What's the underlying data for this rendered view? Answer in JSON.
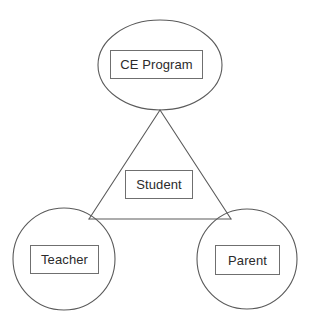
{
  "diagram": {
    "type": "relationship-diagram",
    "background_color": "#ffffff",
    "stroke_color": "#5a5a5a",
    "label_border_color": "#6f6f6f",
    "text_color": "#2b2b2b",
    "nodes": [
      {
        "id": "ce-program",
        "label": "CE Program",
        "shape": "ellipse",
        "cx": 160,
        "cy": 65,
        "rx": 62,
        "ry": 45
      },
      {
        "id": "teacher",
        "label": "Teacher",
        "shape": "circle",
        "cx": 64,
        "cy": 259,
        "rx": 51,
        "ry": 51
      },
      {
        "id": "parent",
        "label": "Parent",
        "shape": "circle",
        "cx": 247,
        "cy": 259,
        "rx": 50,
        "ry": 50
      },
      {
        "id": "student",
        "label": "Student",
        "shape": "rectangle",
        "cx": 159,
        "cy": 184
      }
    ],
    "connections": [
      {
        "id": "ce-program-to-teacher",
        "from": "ce-program",
        "to": "teacher",
        "style": "solid"
      },
      {
        "id": "ce-program-to-parent",
        "from": "ce-program",
        "to": "parent",
        "style": "solid"
      },
      {
        "id": "teacher-to-parent",
        "from": "teacher",
        "to": "parent",
        "style": "solid"
      }
    ]
  }
}
